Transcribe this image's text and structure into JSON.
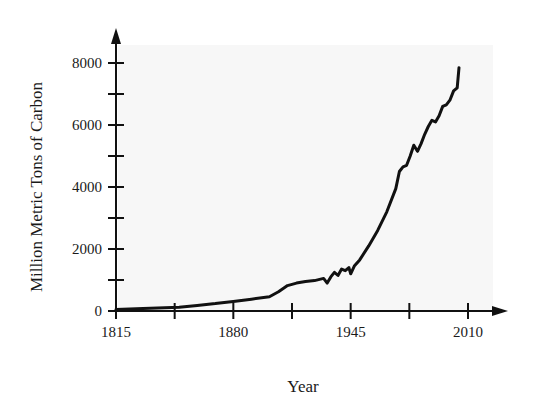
{
  "chart_data": {
    "type": "line",
    "title": "",
    "xlabel": "Year",
    "ylabel": "Million Metric Tons of Carbon",
    "xlim": [
      1815,
      2010
    ],
    "ylim": [
      0,
      8000
    ],
    "x_ticks": [
      1815,
      1880,
      1945,
      2010
    ],
    "x_minor_ticks": [
      1847.5,
      1912.5,
      1977.5
    ],
    "y_ticks": [
      0,
      2000,
      4000,
      6000,
      8000
    ],
    "y_minor_ticks": [
      1000,
      3000,
      5000,
      7000
    ],
    "grid": false,
    "legend": null,
    "series": [
      {
        "name": "Global carbon emissions",
        "x": [
          1815,
          1830,
          1850,
          1860,
          1870,
          1880,
          1890,
          1900,
          1905,
          1910,
          1915,
          1920,
          1925,
          1930,
          1932,
          1934,
          1936,
          1938,
          1940,
          1942,
          1944,
          1945,
          1947,
          1950,
          1955,
          1960,
          1965,
          1970,
          1972,
          1974,
          1976,
          1978,
          1980,
          1982,
          1984,
          1986,
          1988,
          1990,
          1992,
          1994,
          1996,
          1998,
          2000,
          2002,
          2004,
          2005
        ],
        "values": [
          50,
          80,
          120,
          180,
          240,
          310,
          380,
          460,
          620,
          820,
          900,
          950,
          980,
          1050,
          900,
          1100,
          1250,
          1150,
          1350,
          1300,
          1400,
          1200,
          1450,
          1650,
          2100,
          2600,
          3200,
          3950,
          4500,
          4650,
          4700,
          5000,
          5350,
          5150,
          5400,
          5700,
          5950,
          6150,
          6100,
          6300,
          6600,
          6650,
          6800,
          7100,
          7200,
          7850
        ]
      }
    ]
  },
  "axes": {
    "x_tick_labels": [
      "1815",
      "1880",
      "1945",
      "2010"
    ],
    "y_tick_labels": [
      "0",
      "2000",
      "4000",
      "6000",
      "8000"
    ],
    "x_title": "Year",
    "y_title": "Million Metric Tons of Carbon"
  },
  "colors": {
    "line": "#111111",
    "plot_background": "#f7f7f7",
    "axis": "#111111"
  }
}
